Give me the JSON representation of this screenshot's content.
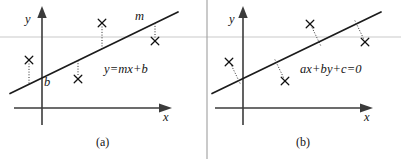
{
  "figure": {
    "type": "diagram",
    "width": 401,
    "height": 159,
    "background_color": "#ffffff",
    "line_color": "#1b1b1b",
    "axis_color": "#3b3b3b",
    "rule_color": "#c9c9c9",
    "marker_glyph": "x"
  },
  "panels": [
    {
      "id": "a",
      "caption": "(a)",
      "equation": "y=mx+b",
      "axis_labels": {
        "x": "x",
        "y": "y"
      },
      "annotations": [
        {
          "name": "slope",
          "text": "m"
        },
        {
          "name": "intercept",
          "text": "b"
        }
      ],
      "residual_type": "vertical",
      "origin": {
        "x": 42,
        "y": 108
      },
      "fit_line": {
        "x1": 10,
        "y1": 93,
        "x2": 178,
        "y2": 12
      },
      "points": [
        {
          "x": 29,
          "y": 60
        },
        {
          "x": 78,
          "y": 79
        },
        {
          "x": 102,
          "y": 23
        },
        {
          "x": 155,
          "y": 41
        }
      ]
    },
    {
      "id": "b",
      "caption": "(b)",
      "equation": "ax+by+c=0",
      "axis_labels": {
        "x": "x",
        "y": "y"
      },
      "annotations": [],
      "residual_type": "perpendicular",
      "origin": {
        "x": 243,
        "y": 108
      },
      "fit_line": {
        "x1": 212,
        "y1": 93,
        "x2": 381,
        "y2": 12
      },
      "points": [
        {
          "x": 229,
          "y": 62
        },
        {
          "x": 285,
          "y": 81
        },
        {
          "x": 310,
          "y": 24
        },
        {
          "x": 365,
          "y": 42
        }
      ]
    }
  ],
  "rules": {
    "horizontal_rule_y": 37,
    "vertical_divider_x": 207
  }
}
